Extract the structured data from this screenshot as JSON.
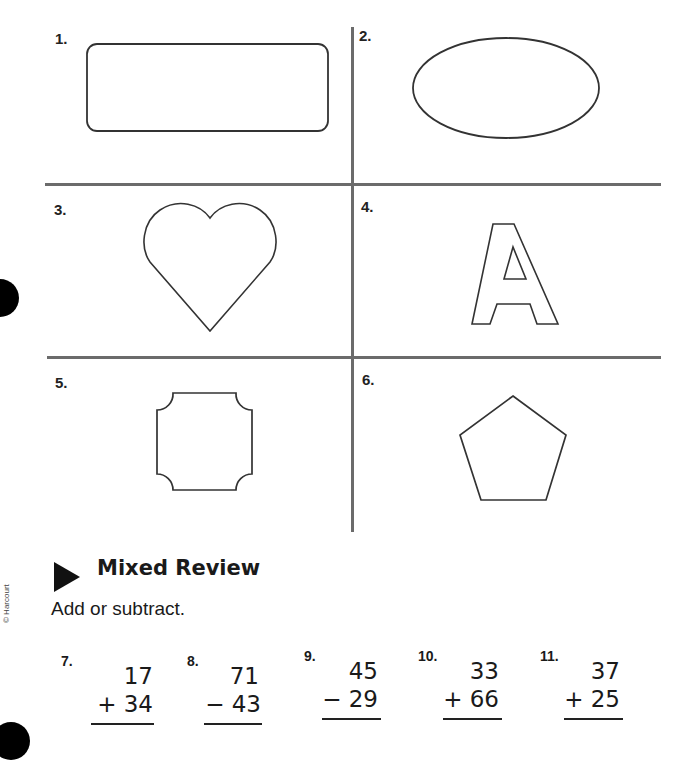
{
  "shapes_section": {
    "cells": [
      {
        "number": "1.",
        "shape": "rounded-rectangle"
      },
      {
        "number": "2.",
        "shape": "oval"
      },
      {
        "number": "3.",
        "shape": "heart"
      },
      {
        "number": "4.",
        "shape": "letter-A-outline"
      },
      {
        "number": "5.",
        "shape": "scalloped-square"
      },
      {
        "number": "6.",
        "shape": "pentagon"
      }
    ]
  },
  "mixed_review": {
    "title": "Mixed Review",
    "instruction": "Add or subtract.",
    "problems": [
      {
        "number": "7.",
        "top": "17",
        "operator": "+",
        "bottom": "34"
      },
      {
        "number": "8.",
        "top": "71",
        "operator": "−",
        "bottom": "43"
      },
      {
        "number": "9.",
        "top": "45",
        "operator": "−",
        "bottom": "29"
      },
      {
        "number": "10.",
        "top": "33",
        "operator": "+",
        "bottom": "66"
      },
      {
        "number": "11.",
        "top": "37",
        "operator": "+",
        "bottom": "25"
      }
    ]
  },
  "copyright": "© Harcourt",
  "colors": {
    "grid": "#6b6b6b",
    "ink": "#1a1a1a"
  }
}
